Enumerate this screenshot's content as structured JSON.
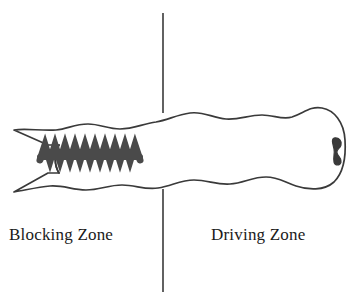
{
  "figure": {
    "background_color": "#ffffff",
    "width": 358,
    "height": 305
  },
  "labels": {
    "left_zone": "Blocking Zone",
    "right_zone": "Driving Zone"
  },
  "divider": {
    "name": "vertical-divider-line",
    "x": 163,
    "y_top": 13,
    "y_bottom": 292,
    "color": "#3a3a3a",
    "width": 1.6
  },
  "shapes": {
    "body_outline": {
      "name": "worm-body-outline",
      "stroke_color": "#3a3a3a",
      "fill_color": "#ffffff",
      "stroke_width": 1.6,
      "x_left": 12,
      "x_right": 346,
      "y_top": 112,
      "y_bottom": 190
    },
    "zigzag": {
      "name": "zigzag-sawtooth-band",
      "color": "#4a4a4a",
      "x_start": 40,
      "x_end": 140,
      "y_top": 142,
      "y_bottom": 163,
      "peaks": 10
    },
    "blob": {
      "name": "dark-knob-blob",
      "color": "#3a3a3a",
      "x": 336,
      "y": 150
    },
    "fork": {
      "name": "left-fork-prongs",
      "color": "#3a3a3a",
      "prong_count": 2
    }
  }
}
